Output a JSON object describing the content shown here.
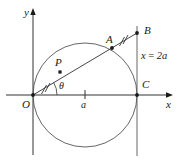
{
  "figure": {
    "kind": "geometry-diagram",
    "stroke_color": "#333333",
    "text_color": "#1a1a1a",
    "background": "#ffffff"
  },
  "axes": {
    "x_label": "x",
    "y_label": "y",
    "origin_label": "O",
    "tick_label": "a"
  },
  "points": {
    "O": "O",
    "P": "P",
    "A": "A",
    "B": "B",
    "C": "C"
  },
  "angle": {
    "label": "θ"
  },
  "lines": {
    "vertical_label": "x = 2a",
    "vertical_label_x": "x",
    "vertical_label_eq": "=",
    "vertical_label_val": "2a"
  },
  "tick_marks": {
    "segment_OP": "double-hash",
    "segment_AB": "double-hash"
  },
  "geometry": {
    "origin_px": [
      33,
      95
    ],
    "circle_center_px": [
      85,
      95
    ],
    "circle_radius_px": 52,
    "point_P_px": [
      60,
      72
    ],
    "point_A_px": [
      112,
      48
    ],
    "point_B_px": [
      137,
      33
    ],
    "point_C_px": [
      137,
      95
    ],
    "vertical_line_x_px": 137,
    "tick_a_x_px": 85
  }
}
